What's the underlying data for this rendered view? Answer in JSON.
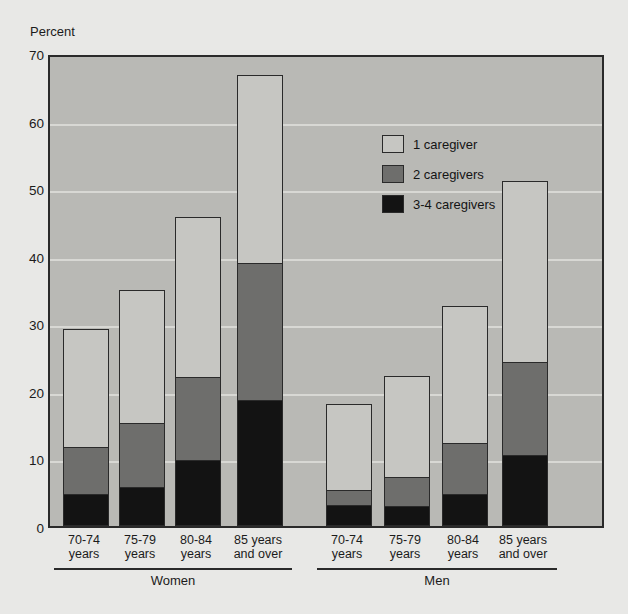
{
  "axis": {
    "unit_label": "Percent",
    "yticks": [
      "70",
      "60",
      "50",
      "40",
      "30",
      "20",
      "10",
      "0"
    ]
  },
  "legend": {
    "items": [
      {
        "label": "1 caregiver",
        "icon": "legend-swatch-light",
        "color": "#c6c6c2"
      },
      {
        "label": "2 caregivers",
        "icon": "legend-swatch-gray",
        "color": "#6e6e6c"
      },
      {
        "label": "3-4 caregivers",
        "icon": "legend-swatch-dark",
        "color": "#131313"
      }
    ]
  },
  "groups": [
    {
      "label": "Women",
      "categories": [
        "70-74\nyears",
        "75-79\nyears",
        "80-84\nyears",
        "85 years\nand over"
      ]
    },
    {
      "label": "Men",
      "categories": [
        "70-74\nyears",
        "75-79\nyears",
        "80-84\nyears",
        "85 years\nand over"
      ]
    }
  ],
  "chart_data": {
    "type": "bar",
    "stacked": true,
    "title": "",
    "xlabel": "",
    "ylabel": "Percent",
    "ylim": [
      0,
      70
    ],
    "ytick_step": 10,
    "grid": true,
    "legend_position": "inside-top-center",
    "group_axis": [
      "Women",
      "Men"
    ],
    "categories": [
      "Women 70-74 years",
      "Women 75-79 years",
      "Women 80-84 years",
      "Women 85 years and over",
      "Men 70-74 years",
      "Men 75-79 years",
      "Men 80-84 years",
      "Men 85 years and over"
    ],
    "series": [
      {
        "name": "1 caregiver",
        "color": "#c6c6c2",
        "values": [
          17.5,
          19.7,
          23.7,
          27.7,
          12.9,
          15.0,
          20.2,
          26.9
        ]
      },
      {
        "name": "2 caregivers",
        "color": "#6e6e6c",
        "values": [
          7.1,
          9.5,
          12.3,
          20.4,
          2.2,
          4.3,
          7.6,
          13.8
        ]
      },
      {
        "name": "3-4 caregivers",
        "color": "#131313",
        "values": [
          4.6,
          5.7,
          9.7,
          18.6,
          3.0,
          2.9,
          4.7,
          10.4
        ]
      }
    ],
    "cumulative_tops": {
      "3-4 caregivers": [
        4.6,
        5.7,
        9.7,
        18.6,
        3.0,
        2.9,
        4.7,
        10.4
      ],
      "2 caregivers": [
        11.7,
        15.2,
        22.0,
        39.0,
        5.2,
        7.2,
        12.3,
        24.2
      ],
      "1 caregiver": [
        29.2,
        34.9,
        45.7,
        66.7,
        18.1,
        22.2,
        32.5,
        51.1
      ]
    },
    "totals": [
      29.2,
      34.9,
      45.7,
      66.7,
      18.1,
      22.2,
      32.5,
      51.1
    ]
  }
}
